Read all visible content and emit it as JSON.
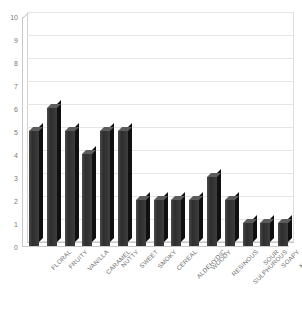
{
  "chart": {
    "title": "",
    "y_axis": {
      "label": "",
      "ticks": [
        "0",
        "1",
        "2",
        "3",
        "4",
        "5",
        "6",
        "7",
        "8",
        "9",
        "10"
      ],
      "min": 0,
      "max": 10
    },
    "x_axis": {
      "label": ""
    }
  },
  "chart_data": {
    "type": "bar",
    "title": "",
    "xlabel": "",
    "ylabel": "",
    "ylim": [
      0,
      10
    ],
    "grid": true,
    "legend": false,
    "orientation": "vertical",
    "style": "3d-column",
    "bar_color": "#3a3a3a",
    "categories": [
      "FLORAL",
      "FRUITY",
      "VANILLA",
      "CARAMEL",
      "NUTTY",
      "SWEET",
      "SMOKY",
      "CEREAL",
      "ALDEHYDIC",
      "WOODY",
      "RESINOUS",
      "SULPHUROUS",
      "SOUR",
      "SOAPY",
      "MUSTY"
    ],
    "values": [
      5,
      6,
      5,
      4,
      5,
      5,
      2,
      2,
      2,
      2,
      3,
      2,
      1,
      1,
      1
    ],
    "ytick_labels": [
      "0",
      "1",
      "2",
      "3",
      "4",
      "5",
      "6",
      "7",
      "8",
      "9",
      "10"
    ],
    "ytick_values": [
      0,
      1,
      2,
      3,
      4,
      5,
      6,
      7,
      8,
      9,
      10
    ]
  },
  "colors": {
    "bar_face": "#3a3a3a",
    "bar_top": "#5c5c5c",
    "bar_side": "#101010",
    "axis": "#c9c9c9",
    "grid": "#e6e6e6",
    "tick_text": "#7a7a7a",
    "background": "#ffffff"
  }
}
